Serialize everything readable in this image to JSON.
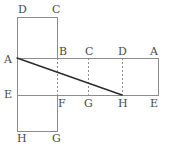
{
  "figure": {
    "type": "geometry-net-diagram",
    "canvas": {
      "width": 170,
      "height": 149
    },
    "colors": {
      "background": "#ffffff",
      "outline": "#8c8c8c",
      "dashed": "#8c8c8c",
      "diagonal": "#2b2b2b",
      "label": "#4a4a4a"
    },
    "geometry": {
      "top_rect": {
        "x1": 17,
        "y1": 17,
        "x2": 57,
        "y2": 58
      },
      "middle_rect": {
        "x1": 17,
        "y1": 58,
        "x2": 158,
        "y2": 95
      },
      "bottom_rect": {
        "x1": 17,
        "y1": 95,
        "x2": 57,
        "y2": 131
      },
      "diagonal": {
        "x1": 17,
        "y1": 58,
        "x2": 122,
        "y2": 95
      },
      "dashed_verticals": [
        {
          "x": 57,
          "y1": 58,
          "y2": 95
        },
        {
          "x": 88,
          "y1": 58,
          "y2": 95
        },
        {
          "x": 122,
          "y1": 58,
          "y2": 95
        }
      ],
      "dashed_horizontals": [
        {
          "y": 58,
          "x1": 17,
          "x2": 57
        },
        {
          "y": 95,
          "x1": 17,
          "x2": 57
        }
      ]
    },
    "vertex_labels": [
      {
        "id": "label-top-D",
        "text": "D",
        "x": 18,
        "y": 4
      },
      {
        "id": "label-top-C",
        "text": "C",
        "x": 52,
        "y": 4
      },
      {
        "id": "label-left-A",
        "text": "A",
        "x": 4,
        "y": 54
      },
      {
        "id": "label-mid-B",
        "text": "B",
        "x": 59,
        "y": 46
      },
      {
        "id": "label-mid-C",
        "text": "C",
        "x": 85,
        "y": 46
      },
      {
        "id": "label-mid-D",
        "text": "D",
        "x": 118,
        "y": 46
      },
      {
        "id": "label-right-A",
        "text": "A",
        "x": 150,
        "y": 46
      },
      {
        "id": "label-left-E",
        "text": "E",
        "x": 4,
        "y": 89
      },
      {
        "id": "label-mid-F",
        "text": "F",
        "x": 58,
        "y": 98
      },
      {
        "id": "label-mid-G",
        "text": "G",
        "x": 84,
        "y": 98
      },
      {
        "id": "label-mid-H",
        "text": "H",
        "x": 118,
        "y": 98
      },
      {
        "id": "label-right-E",
        "text": "E",
        "x": 150,
        "y": 98
      },
      {
        "id": "label-bottom-H",
        "text": "H",
        "x": 17,
        "y": 133
      },
      {
        "id": "label-bottom-G",
        "text": "G",
        "x": 52,
        "y": 133
      }
    ]
  }
}
